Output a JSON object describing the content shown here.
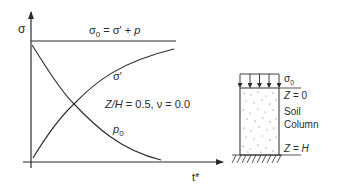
{
  "graph": {
    "y_axis_label": "σ",
    "x_axis_label": "t*",
    "total_stress_equation": {
      "sigma0": "σ",
      "sigma0_sub": "0",
      "rest": " = σ' + ",
      "p": "p"
    },
    "curve_effective_stress_label": "σ'",
    "curve_pore_pressure_label": "p",
    "curve_pore_pressure_sub": "0",
    "params_label": {
      "zh": "Z/H",
      "rest": " = 0.5, ν = 0.0"
    }
  },
  "soil_column": {
    "load_label": "σ",
    "load_sub": "0",
    "top_label_z": "Z",
    "top_label_rest": " = 0",
    "name_line1": "Soil",
    "name_line2": "Column",
    "bottom_label_z": "Z",
    "bottom_label_h": "H",
    "bottom_label_eq": " = "
  },
  "colors": {
    "line": "#2a2a2a",
    "text": "#2a2a2a"
  }
}
